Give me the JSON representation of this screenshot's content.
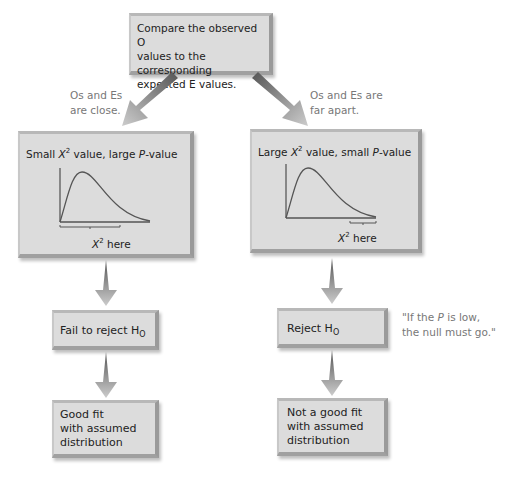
{
  "top_box": {
    "line1": "Compare the observed O",
    "line2": "values to the corresponding",
    "line3": "expected E values."
  },
  "left_note": {
    "line1": "Os and Es",
    "line2": "are close."
  },
  "right_note": {
    "line1": "Os and Es are",
    "line2": "far apart."
  },
  "left_panel": {
    "title_a": "Small ",
    "title_x": "X",
    "title_sup": "2",
    "title_b": " value, large ",
    "title_p": "P",
    "title_c": "-value",
    "axis_x": "X",
    "axis_sup": "2",
    "axis_label": " here"
  },
  "right_panel": {
    "title_a": "Large ",
    "title_x": "X",
    "title_sup": "2",
    "title_b": " value, small ",
    "title_p": "P",
    "title_c": "-value",
    "axis_x": "X",
    "axis_sup": "2",
    "axis_label": " here"
  },
  "left_decision": {
    "text": "Fail to reject H",
    "sub": "O"
  },
  "right_decision": {
    "text": "Reject H",
    "sub": "O"
  },
  "left_result": {
    "line1": "Good fit",
    "line2": "with assumed",
    "line3": "distribution"
  },
  "right_result": {
    "line1": "Not a good fit",
    "line2": "with assumed",
    "line3": "distribution"
  },
  "quote": {
    "line1a": "\"If the ",
    "line1p": "P",
    "line1b": " is low,",
    "line2": "the null must go.\""
  }
}
